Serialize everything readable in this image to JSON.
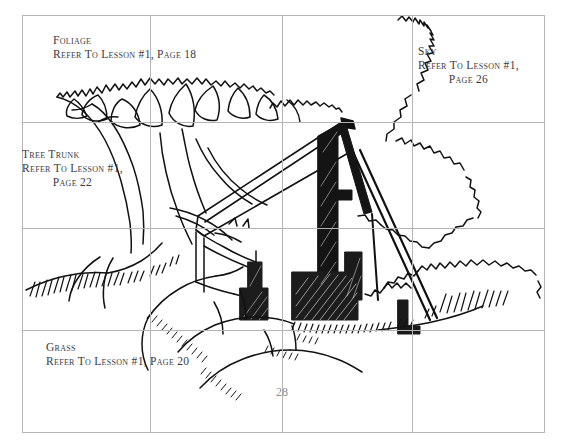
{
  "page": {
    "number": "28",
    "background_color": "#ffffff",
    "grid_color": "#b5b5b5",
    "ink_color": "#000000",
    "label_color": "#3a3a42",
    "page_number_color": "#8d8d93"
  },
  "grid": {
    "frame": {
      "left": 22,
      "top": 15,
      "right": 545,
      "bottom": 433
    },
    "vertical_lines": [
      150,
      282,
      412
    ],
    "horizontal_lines": [
      122,
      228,
      330
    ],
    "columns": 4,
    "rows": 4
  },
  "labels": [
    {
      "id": "foliage",
      "title": "Foliage",
      "lines": [
        "Refer To Lesson #1, Page 18"
      ],
      "reference_lesson": "#1",
      "reference_page": "18"
    },
    {
      "id": "tree-trunk",
      "title": "Tree Trunk",
      "lines": [
        "Refer To Lesson #1,",
        "Page 22"
      ],
      "reference_lesson": "#1",
      "reference_page": "22"
    },
    {
      "id": "sky",
      "title": "Sky",
      "lines": [
        "Refer To Lesson #1,",
        "Page 26"
      ],
      "reference_lesson": "#1",
      "reference_page": "26"
    },
    {
      "id": "grass",
      "title": "Grass",
      "lines": [
        "Refer To Lesson #1, Page 20"
      ],
      "reference_lesson": "#1",
      "reference_page": "20"
    }
  ],
  "illustration": {
    "description": "Pen-and-ink landscape drawing: a gnarled tree at left, a barn with steep shed roof at center, clouds at right, rolling grassy hills in the foreground.",
    "elements": [
      "foliage-canopy",
      "tree-trunk",
      "barn-roof",
      "barn-gable",
      "chimney",
      "hills",
      "grass-tufts",
      "clouds"
    ]
  }
}
